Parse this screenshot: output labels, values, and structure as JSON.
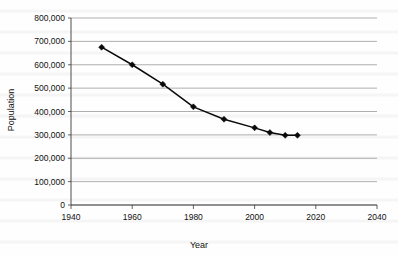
{
  "chart_data": {
    "type": "line",
    "title": "",
    "xlabel": "Year",
    "ylabel": "Population",
    "xlim": [
      1940,
      2040
    ],
    "ylim": [
      0,
      800000
    ],
    "grid": "horizontal",
    "legend": "none",
    "marker": "diamond",
    "line_color": "#0a0a0a",
    "grid_color": "#8d8d8d",
    "x_ticks": [
      "1940",
      "1960",
      "1980",
      "2000",
      "2020",
      "2040"
    ],
    "x_tick_values": [
      1940,
      1960,
      1980,
      2000,
      2020,
      2040
    ],
    "y_ticks": [
      "0",
      "100,000",
      "200,000",
      "300,000",
      "400,000",
      "500,000",
      "600,000",
      "700,000",
      "800,000"
    ],
    "y_tick_values": [
      0,
      100000,
      200000,
      300000,
      400000,
      500000,
      600000,
      700000,
      800000
    ],
    "x": [
      1950,
      1960,
      1970,
      1980,
      1990,
      2000,
      2005,
      2010,
      2014
    ],
    "values": [
      675000,
      600000,
      517000,
      420000,
      367000,
      330000,
      310000,
      298000,
      298000
    ],
    "series": [
      {
        "name": "Population",
        "points": [
          {
            "x": 1950,
            "y": 675000
          },
          {
            "x": 1960,
            "y": 600000
          },
          {
            "x": 1970,
            "y": 517000
          },
          {
            "x": 1980,
            "y": 420000
          },
          {
            "x": 1990,
            "y": 367000
          },
          {
            "x": 2000,
            "y": 330000
          },
          {
            "x": 2005,
            "y": 310000
          },
          {
            "x": 2010,
            "y": 298000
          },
          {
            "x": 2014,
            "y": 298000
          }
        ]
      }
    ]
  }
}
